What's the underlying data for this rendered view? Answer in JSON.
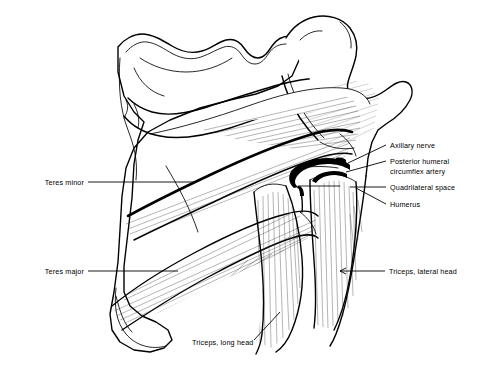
{
  "figure": {
    "kind": "anatomical-line-drawing",
    "view": "posterior shoulder",
    "background_color": "#ffffff",
    "ink_color": "#000000"
  },
  "labels": {
    "teres_minor": "Teres minor",
    "teres_major": "Teres major",
    "axillary_nerve": "Axillary nerve",
    "posterior_humeral_line1": "Posterior humeral",
    "posterior_humeral_line2": "circumflex artery",
    "quadrilateral_space": "Quadrilateral space",
    "humerus": "Humerus",
    "triceps_lateral_head": "Triceps, lateral head",
    "triceps_long_head": "Triceps, long head"
  },
  "structures": {
    "scapula": "scapula",
    "humerus": "humerus",
    "acromion": "acromion",
    "teres_minor_muscle": "teres minor muscle",
    "teres_major_muscle": "teres major muscle",
    "triceps_long_head_muscle": "triceps long head muscle",
    "triceps_lateral_head_muscle": "triceps lateral head muscle",
    "axillary_nerve_structure": "axillary nerve",
    "circumflex_artery_structure": "posterior humeral circumflex artery",
    "quadrilateral_space_region": "quadrilateral space"
  }
}
